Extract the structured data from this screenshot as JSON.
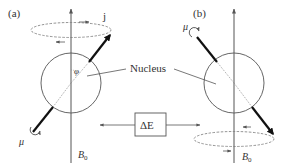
{
  "diagram": {
    "panels": [
      {
        "id": "a",
        "label": "(a)",
        "angular_momentum_label": "j",
        "angle_label": "φ",
        "moment_label": "μ",
        "field_label": "B",
        "field_subscript": "0"
      },
      {
        "id": "b",
        "label": "(b)",
        "moment_label": "μ",
        "field_label": "B",
        "field_subscript": "0"
      }
    ],
    "nucleus_label": "Nucleus",
    "energy_box_label": "ΔE",
    "colors": {
      "stroke": "#555555",
      "vector": "#111111",
      "text": "#333333",
      "background": "#ffffff"
    }
  }
}
